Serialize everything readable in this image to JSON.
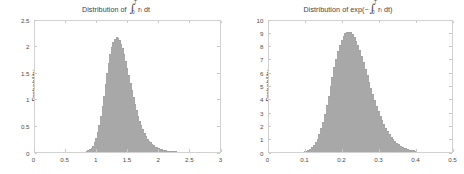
{
  "figure": {
    "width": 464,
    "height": 174,
    "background": "#ffffff",
    "bar_fill": "#e8e8e8",
    "bar_edge": "#9a9a9a",
    "axis_color": "#d2d2d2",
    "text_color": "#3f3f3f"
  },
  "panels": [
    {
      "id": "left",
      "title_prefix": "Distribution of ",
      "title_int": "∫",
      "title_lim_upper": "T",
      "title_lim_lower": "0",
      "title_body": " r",
      "title_sub": "t",
      "title_suffix": " dt",
      "title_plain": "Distribution of ∫₀ᵀ r_t dt",
      "ylabel": "Probability",
      "xticks": [
        "0",
        "0.5",
        "1",
        "1.5",
        "2",
        "2.5",
        "3"
      ],
      "yticks": [
        "0",
        "0.5",
        "1",
        "1.5",
        "2",
        "2.5"
      ]
    },
    {
      "id": "right",
      "title_prefix": "Distribution of exp(−",
      "title_int": "∫",
      "title_lim_upper": "T",
      "title_lim_lower": "0",
      "title_body": " r",
      "title_sub": "t",
      "title_suffix": " dt)",
      "title_plain": "Distribution of exp(−∫₀ᵀ r_t dt)",
      "ylabel": "Probability",
      "xticks": [
        "0",
        "0.1",
        "0.2",
        "0.3",
        "0.4",
        "0.5"
      ],
      "yticks": [
        "0",
        "1",
        "2",
        "3",
        "4",
        "5",
        "6",
        "7",
        "8",
        "9",
        "10"
      ]
    }
  ],
  "chart_data": [
    {
      "type": "bar",
      "id": "left-histogram",
      "title": "Distribution of ∫₀ᵀ r_t dt",
      "xlabel": "",
      "ylabel": "Probability",
      "xlim": [
        0,
        3
      ],
      "ylim": [
        0,
        2.5
      ],
      "xticks": [
        0,
        0.5,
        1,
        1.5,
        2,
        2.5,
        3
      ],
      "yticks": [
        0,
        0.5,
        1,
        1.5,
        2,
        2.5
      ],
      "grid": false,
      "legend": null,
      "bin_width": 0.025,
      "bin_centers": [
        0.8375,
        0.8625,
        0.8875,
        0.9125,
        0.9375,
        0.9625,
        0.9875,
        1.0125,
        1.0375,
        1.0625,
        1.0875,
        1.1125,
        1.1375,
        1.1625,
        1.1875,
        1.2125,
        1.2375,
        1.2625,
        1.2875,
        1.3125,
        1.3375,
        1.3625,
        1.3875,
        1.4125,
        1.4375,
        1.4625,
        1.4875,
        1.5125,
        1.5375,
        1.5625,
        1.5875,
        1.6125,
        1.6375,
        1.6625,
        1.6875,
        1.7125,
        1.7375,
        1.7625,
        1.7875,
        1.8125,
        1.8375,
        1.8625,
        1.8875,
        1.9125,
        1.9375,
        1.9625,
        1.9875,
        2.0125,
        2.0375,
        2.0625,
        2.0875,
        2.1125,
        2.1375,
        2.1625,
        2.1875,
        2.2125,
        2.2375,
        2.2625,
        2.2875,
        2.3125
      ],
      "values": [
        0.01,
        0.02,
        0.04,
        0.07,
        0.11,
        0.17,
        0.25,
        0.36,
        0.5,
        0.66,
        0.85,
        1.05,
        1.26,
        1.47,
        1.66,
        1.83,
        1.96,
        2.06,
        2.12,
        2.15,
        2.14,
        2.1,
        2.03,
        1.94,
        1.83,
        1.7,
        1.57,
        1.43,
        1.29,
        1.15,
        1.02,
        0.9,
        0.78,
        0.67,
        0.58,
        0.49,
        0.42,
        0.35,
        0.29,
        0.24,
        0.2,
        0.17,
        0.14,
        0.115,
        0.094,
        0.077,
        0.062,
        0.05,
        0.04,
        0.032,
        0.026,
        0.021,
        0.016,
        0.013,
        0.01,
        0.008,
        0.006,
        0.005,
        0.004,
        0.003
      ]
    },
    {
      "type": "bar",
      "id": "right-histogram",
      "title": "Distribution of exp(−∫₀ᵀ r_t dt)",
      "xlabel": "",
      "ylabel": "Probability",
      "xlim": [
        0,
        0.5
      ],
      "ylim": [
        0,
        10
      ],
      "xticks": [
        0,
        0.1,
        0.2,
        0.3,
        0.4,
        0.5
      ],
      "yticks": [
        0,
        1,
        2,
        3,
        4,
        5,
        6,
        7,
        8,
        9,
        10
      ],
      "grid": false,
      "legend": null,
      "bin_width": 0.005,
      "bin_centers": [
        0.0975,
        0.1025,
        0.1075,
        0.1125,
        0.1175,
        0.1225,
        0.1275,
        0.1325,
        0.1375,
        0.1425,
        0.1475,
        0.1525,
        0.1575,
        0.1625,
        0.1675,
        0.1725,
        0.1775,
        0.1825,
        0.1875,
        0.1925,
        0.1975,
        0.2025,
        0.2075,
        0.2125,
        0.2175,
        0.2225,
        0.2275,
        0.2325,
        0.2375,
        0.2425,
        0.2475,
        0.2525,
        0.2575,
        0.2625,
        0.2675,
        0.2725,
        0.2775,
        0.2825,
        0.2875,
        0.2925,
        0.2975,
        0.3025,
        0.3075,
        0.3125,
        0.3175,
        0.3225,
        0.3275,
        0.3325,
        0.3375,
        0.3425,
        0.3475,
        0.3525,
        0.3575,
        0.3625,
        0.3675,
        0.3725,
        0.3775,
        0.3825,
        0.3875,
        0.3925,
        0.3975
      ],
      "values": [
        0.03,
        0.06,
        0.11,
        0.19,
        0.31,
        0.47,
        0.69,
        0.97,
        1.32,
        1.74,
        2.24,
        2.82,
        3.46,
        4.16,
        4.9,
        5.63,
        6.33,
        6.98,
        7.55,
        8.03,
        8.41,
        8.7,
        8.9,
        9.0,
        9.02,
        8.96,
        8.83,
        8.62,
        8.34,
        8.0,
        7.61,
        7.18,
        6.72,
        6.24,
        5.75,
        5.26,
        4.78,
        4.31,
        3.86,
        3.44,
        3.05,
        2.68,
        2.35,
        2.04,
        1.77,
        1.52,
        1.3,
        1.1,
        0.93,
        0.78,
        0.65,
        0.54,
        0.44,
        0.36,
        0.29,
        0.23,
        0.18,
        0.14,
        0.11,
        0.085,
        0.065
      ]
    }
  ]
}
